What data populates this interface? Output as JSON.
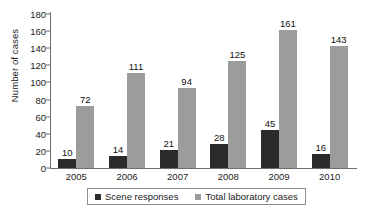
{
  "chart_data": {
    "type": "bar",
    "title": "",
    "xlabel": "",
    "ylabel": "Number of cases",
    "categories": [
      "2005",
      "2006",
      "2007",
      "2008",
      "2009",
      "2010"
    ],
    "series": [
      {
        "name": "Scene responses",
        "color": "#2b2b2b",
        "values": [
          10,
          14,
          21,
          28,
          45,
          16
        ]
      },
      {
        "name": "Total laboratory cases",
        "color": "#9c9c9c",
        "values": [
          72,
          111,
          94,
          125,
          161,
          143
        ]
      }
    ],
    "ylim": [
      0,
      180
    ],
    "ytick_step": 20,
    "yticks": [
      "0",
      "20",
      "40",
      "60",
      "80",
      "100",
      "120",
      "140",
      "160",
      "180"
    ],
    "grid": false,
    "legend_position": "bottom",
    "data_labels": true
  },
  "legend": {
    "entries": [
      {
        "label": "Scene responses"
      },
      {
        "label": "Total laboratory cases"
      }
    ]
  }
}
